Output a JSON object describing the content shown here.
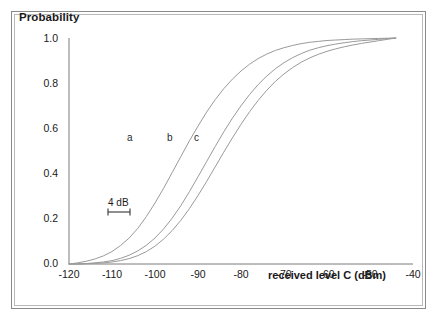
{
  "figure": {
    "frame": true,
    "border_color": "#8a8a8a"
  },
  "chart_data": {
    "type": "line",
    "title": "",
    "xlabel": "received level C (dBm)",
    "ylabel": "Probability",
    "xlim": [
      -120,
      -40
    ],
    "ylim": [
      0.0,
      1.0
    ],
    "xticks": [
      -120,
      -110,
      -100,
      -90,
      -80,
      -70,
      -60,
      -50,
      -40
    ],
    "yticks": [
      "0.0",
      "0.2",
      "0.4",
      "0.6",
      "0.8",
      "1.0"
    ],
    "xticklabels": [
      "-120",
      "-110",
      "-100",
      "-90",
      "-80",
      "-70",
      "-60",
      "-50",
      "-40"
    ],
    "grid": false,
    "legend": "inline-curve-labels",
    "line_color": "#9a9a9a",
    "x": [
      -120,
      -118,
      -116,
      -114,
      -112,
      -110,
      -108,
      -106,
      -104,
      -102,
      -100,
      -98,
      -96,
      -94,
      -92,
      -90,
      -88,
      -86,
      -84,
      -82,
      -80,
      -78,
      -76,
      -74,
      -72,
      -70,
      -68,
      -66,
      -64,
      -62,
      -60,
      -58,
      -56,
      -54,
      -52,
      -50,
      -48,
      -46,
      -44
    ],
    "series": [
      {
        "name": "a",
        "label": "a",
        "midpoint_dbm": -94,
        "values": [
          0.0,
          0.005,
          0.012,
          0.022,
          0.036,
          0.055,
          0.082,
          0.115,
          0.158,
          0.21,
          0.27,
          0.335,
          0.405,
          0.475,
          0.545,
          0.61,
          0.672,
          0.727,
          0.776,
          0.818,
          0.854,
          0.884,
          0.909,
          0.929,
          0.945,
          0.957,
          0.967,
          0.975,
          0.981,
          0.985,
          0.989,
          0.991,
          0.993,
          0.995,
          0.996,
          0.997,
          0.998,
          0.999,
          1.0
        ]
      },
      {
        "name": "b",
        "label": "b",
        "midpoint_dbm": -86,
        "values": [
          0.0,
          0.0,
          0.002,
          0.005,
          0.009,
          0.015,
          0.025,
          0.039,
          0.058,
          0.083,
          0.115,
          0.155,
          0.203,
          0.258,
          0.32,
          0.386,
          0.453,
          0.52,
          0.585,
          0.645,
          0.7,
          0.75,
          0.794,
          0.832,
          0.864,
          0.891,
          0.913,
          0.931,
          0.946,
          0.957,
          0.966,
          0.973,
          0.979,
          0.984,
          0.988,
          0.991,
          0.994,
          0.997,
          1.0
        ]
      },
      {
        "name": "c",
        "label": "c",
        "midpoint_dbm": -83,
        "values": [
          0.0,
          0.0,
          0.001,
          0.003,
          0.005,
          0.009,
          0.015,
          0.024,
          0.037,
          0.055,
          0.079,
          0.11,
          0.148,
          0.193,
          0.245,
          0.303,
          0.365,
          0.43,
          0.495,
          0.558,
          0.618,
          0.674,
          0.724,
          0.769,
          0.808,
          0.841,
          0.869,
          0.893,
          0.912,
          0.928,
          0.941,
          0.952,
          0.961,
          0.969,
          0.976,
          0.982,
          0.988,
          0.994,
          1.0
        ]
      }
    ],
    "annotations": [
      {
        "name": "spacing-annotation",
        "text": "4 dB",
        "x_dbm": -97,
        "y_prob": 0.27,
        "type": "measure-bar"
      }
    ]
  }
}
